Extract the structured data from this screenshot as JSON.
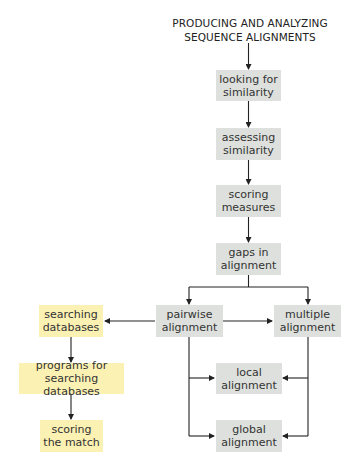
{
  "title": {
    "line1": "PRODUCING AND ANALYZING",
    "line2": "SEQUENCE ALIGNMENTS"
  },
  "colors": {
    "gray_box": "#dde0dc",
    "yellow_box": "#fbf1b3",
    "arrow": "#222222"
  },
  "nodes": {
    "looking": {
      "line1": "looking for",
      "line2": "similarity"
    },
    "assessing": {
      "line1": "assessing",
      "line2": "similarity"
    },
    "scoring_measures": {
      "line1": "scoring",
      "line2": "measures"
    },
    "gaps": {
      "line1": "gaps in",
      "line2": "alignment"
    },
    "pairwise": {
      "line1": "pairwise",
      "line2": "alignment"
    },
    "multiple": {
      "line1": "multiple",
      "line2": "alignment"
    },
    "searching": {
      "line1": "searching",
      "line2": "databases"
    },
    "programs": {
      "line1": "programs for",
      "line2": "searching databases"
    },
    "scoring_match": {
      "line1": "scoring",
      "line2": "the match"
    },
    "local": {
      "line1": "local",
      "line2": "alignment"
    },
    "global": {
      "line1": "global",
      "line2": "alignment"
    }
  },
  "edges": [
    [
      "title",
      "looking"
    ],
    [
      "looking",
      "assessing"
    ],
    [
      "assessing",
      "scoring_measures"
    ],
    [
      "scoring_measures",
      "gaps"
    ],
    [
      "gaps",
      "pairwise"
    ],
    [
      "gaps",
      "multiple"
    ],
    [
      "pairwise",
      "searching"
    ],
    [
      "pairwise",
      "multiple"
    ],
    [
      "pairwise",
      "local"
    ],
    [
      "pairwise",
      "global"
    ],
    [
      "multiple",
      "local"
    ],
    [
      "multiple",
      "global"
    ],
    [
      "searching",
      "programs"
    ],
    [
      "programs",
      "scoring_match"
    ]
  ]
}
